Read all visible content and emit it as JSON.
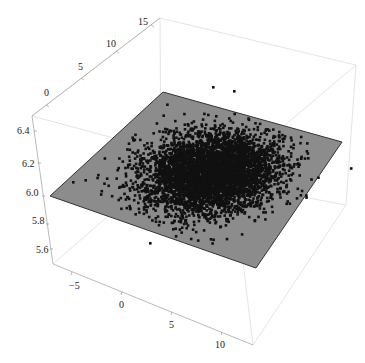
{
  "chart_data": {
    "type": "scatter",
    "dimension": "3d",
    "title": "",
    "axes": {
      "x": {
        "label": "",
        "ticks": [
          "-5",
          "0",
          "5",
          "10"
        ],
        "range": [
          -8,
          12
        ]
      },
      "y": {
        "label": "",
        "ticks": [
          "0",
          "5",
          "10",
          "15"
        ],
        "range": [
          -3,
          16
        ]
      },
      "z": {
        "label": "",
        "ticks": [
          "5.6",
          "5.8",
          "6.0",
          "6.2",
          "6.4"
        ],
        "range": [
          5.5,
          6.5
        ]
      }
    },
    "plane": {
      "z": 6.0,
      "color": "#8c8c8c",
      "edge_color": "#333333"
    },
    "points": {
      "color": "#111111",
      "approx_count": 5000,
      "center_x": 2,
      "center_y": 5,
      "spread_sd": 2.5,
      "outliers_below_plane": 1
    },
    "box": true,
    "grid": false,
    "legend": null
  },
  "labels": {
    "y_ticks": [
      "15",
      "10",
      "5",
      "0"
    ],
    "z_ticks": [
      "6.4",
      "6.2",
      "6.0",
      "5.8",
      "5.6"
    ],
    "x_ticks": [
      "-5",
      "0",
      "5",
      "10"
    ]
  }
}
